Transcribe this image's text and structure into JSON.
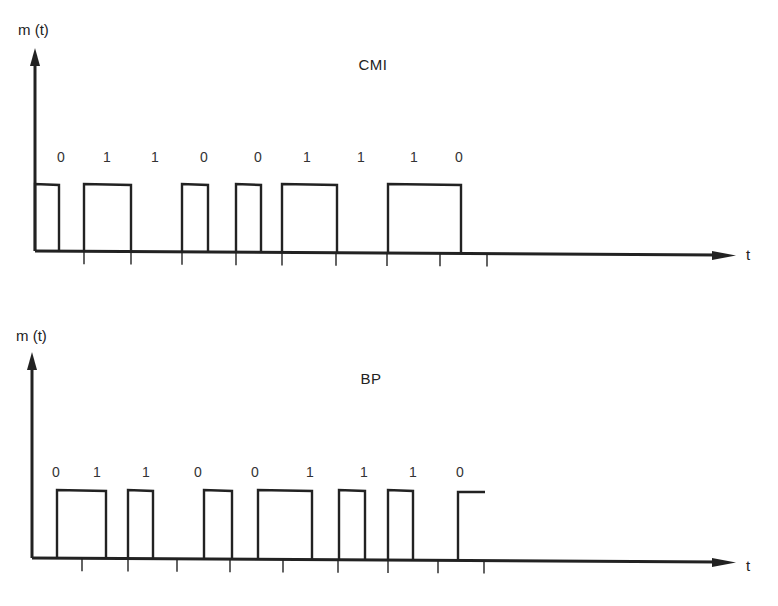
{
  "diagrams": [
    {
      "id": "cmi",
      "title": "CMI",
      "y_axis_label": "m (t)",
      "x_axis_label": "t",
      "bits": [
        "0",
        "1",
        "1",
        "0",
        "0",
        "1",
        "1",
        "1",
        "0"
      ],
      "bit_label_x": [
        61,
        107,
        155,
        204,
        258,
        307,
        361,
        414,
        459
      ],
      "bit_label_y": 149,
      "axis": {
        "origin_x": 35,
        "baseline_y": 251,
        "top_y": 48,
        "end_x": 736
      },
      "high_y": 184,
      "pulses": [
        [
          35,
          59
        ],
        [
          84,
          131
        ],
        [
          182,
          208
        ],
        [
          236,
          261
        ],
        [
          282,
          337
        ],
        [
          388,
          461
        ]
      ],
      "ticks_x": [
        84,
        131,
        182,
        236,
        282,
        336,
        387,
        440,
        487
      ],
      "title_pos": {
        "x": 373,
        "y": 56
      },
      "y_label_pos": {
        "x": 18,
        "y": 21
      },
      "x_label_pos": {
        "x": 746,
        "y": 246
      }
    },
    {
      "id": "bp",
      "title": "BP",
      "y_axis_label": "m (t)",
      "x_axis_label": "t",
      "bits": [
        "0",
        "1",
        "1",
        "0",
        "0",
        "1",
        "1",
        "1",
        "0"
      ],
      "bit_label_x": [
        56,
        97,
        146,
        198,
        255,
        310,
        364,
        413,
        460
      ],
      "bit_label_y": 464,
      "axis": {
        "origin_x": 32,
        "baseline_y": 558,
        "top_y": 352,
        "end_x": 736
      },
      "high_y": 490,
      "pulses": [
        [
          57,
          106
        ],
        [
          128,
          153
        ],
        [
          204,
          232
        ],
        [
          258,
          312
        ],
        [
          339,
          365
        ],
        [
          388,
          413
        ]
      ],
      "partial_pulse": {
        "rise_x": 458,
        "end_x": 485
      },
      "ticks_x": [
        82,
        128,
        177,
        230,
        283,
        338,
        388,
        438,
        484
      ],
      "title_pos": {
        "x": 371,
        "y": 370
      },
      "y_label_pos": {
        "x": 16,
        "y": 327
      },
      "x_label_pos": {
        "x": 746,
        "y": 557
      }
    }
  ]
}
